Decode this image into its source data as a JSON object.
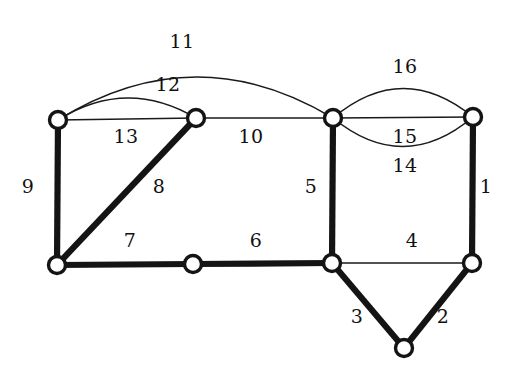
{
  "figure": {
    "kind": "undirected-graph-diagram",
    "background_color": "#ffffff",
    "ink_color": "#141414",
    "width": 512,
    "height": 375
  },
  "nodes": [
    {
      "id": "n1",
      "name": "node-top-left",
      "x": 58,
      "y": 120
    },
    {
      "id": "n2",
      "name": "node-top-inner",
      "x": 196,
      "y": 118
    },
    {
      "id": "n3",
      "name": "node-top-center",
      "x": 333,
      "y": 118
    },
    {
      "id": "n4",
      "name": "node-top-right",
      "x": 473,
      "y": 117
    },
    {
      "id": "n5",
      "name": "node-bottom-left",
      "x": 57,
      "y": 265
    },
    {
      "id": "n6",
      "name": "node-bottom-middle",
      "x": 193,
      "y": 264
    },
    {
      "id": "n7",
      "name": "node-bottom-center",
      "x": 332,
      "y": 263
    },
    {
      "id": "n8",
      "name": "node-bottom-right",
      "x": 472,
      "y": 263
    },
    {
      "id": "n9",
      "name": "node-bottom-apex",
      "x": 404,
      "y": 348
    }
  ],
  "edges": [
    {
      "label": "1",
      "from": "n4",
      "to": "n8",
      "weight": "thick",
      "shape": "line",
      "label_x": 486,
      "label_y": 186
    },
    {
      "label": "2",
      "from": "n8",
      "to": "n9",
      "weight": "thick",
      "shape": "line",
      "label_x": 443,
      "label_y": 316
    },
    {
      "label": "3",
      "from": "n7",
      "to": "n9",
      "weight": "thick",
      "shape": "line",
      "label_x": 357,
      "label_y": 316
    },
    {
      "label": "4",
      "from": "n7",
      "to": "n8",
      "weight": "thin",
      "shape": "line",
      "label_x": 412,
      "label_y": 240
    },
    {
      "label": "5",
      "from": "n3",
      "to": "n7",
      "weight": "thick",
      "shape": "line",
      "label_x": 311,
      "label_y": 186
    },
    {
      "label": "6",
      "from": "n6",
      "to": "n7",
      "weight": "thick",
      "shape": "line",
      "label_x": 256,
      "label_y": 240
    },
    {
      "label": "7",
      "from": "n5",
      "to": "n6",
      "weight": "thick",
      "shape": "line",
      "label_x": 130,
      "label_y": 240
    },
    {
      "label": "8",
      "from": "n5",
      "to": "n2",
      "weight": "thick",
      "shape": "line",
      "label_x": 159,
      "label_y": 186
    },
    {
      "label": "9",
      "from": "n1",
      "to": "n5",
      "weight": "thick",
      "shape": "line",
      "label_x": 28,
      "label_y": 186
    },
    {
      "label": "10",
      "from": "n2",
      "to": "n3",
      "weight": "thin",
      "shape": "line",
      "label_x": 251,
      "label_y": 136
    },
    {
      "label": "11",
      "from": "n1",
      "to": "n3",
      "weight": "thin",
      "shape": "arc-up-large",
      "label_x": 182,
      "label_y": 41
    },
    {
      "label": "12",
      "from": "n1",
      "to": "n2",
      "weight": "thin",
      "shape": "arc-up-small",
      "label_x": 168,
      "label_y": 84
    },
    {
      "label": "13",
      "from": "n1",
      "to": "n2",
      "weight": "thin",
      "shape": "line",
      "label_x": 126,
      "label_y": 136
    },
    {
      "label": "14",
      "from": "n3",
      "to": "n4",
      "weight": "thin",
      "shape": "arc-down",
      "label_x": 405,
      "label_y": 165
    },
    {
      "label": "15",
      "from": "n3",
      "to": "n4",
      "weight": "thin",
      "shape": "line",
      "label_x": 405,
      "label_y": 136
    },
    {
      "label": "16",
      "from": "n3",
      "to": "n4",
      "weight": "thin",
      "shape": "arc-up",
      "label_x": 405,
      "label_y": 66
    }
  ],
  "node_radius": 8.5
}
